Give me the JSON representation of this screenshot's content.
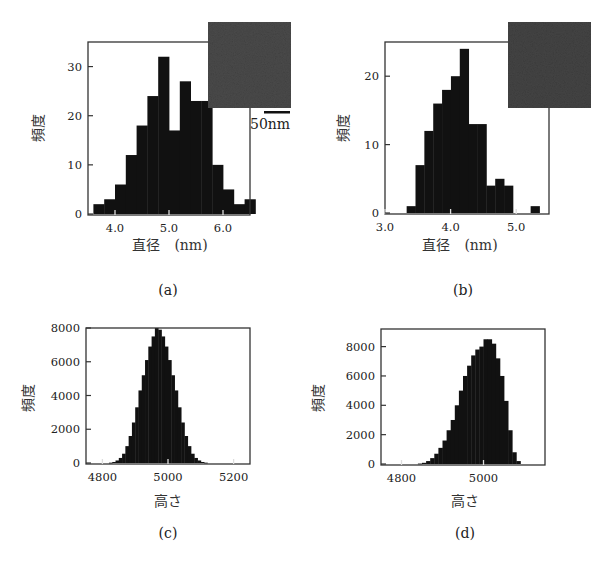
{
  "chart_data": [
    {
      "id": "a",
      "type": "bar",
      "panel_label": "(a)",
      "xlabel": "直径　(nm)",
      "ylabel": "頻度",
      "xlim": [
        3.5,
        6.5
      ],
      "ylim": [
        0,
        35
      ],
      "xticks": [
        4.0,
        5.0,
        6.0
      ],
      "xtick_labels": [
        "4.0",
        "5.0",
        "6.0"
      ],
      "yticks": [
        0,
        10,
        20,
        30
      ],
      "ytick_labels": [
        "0",
        "10",
        "20",
        "30"
      ],
      "bin_start": 3.6,
      "bin_width": 0.2,
      "values": [
        2,
        3,
        6,
        12,
        18,
        24,
        32,
        17,
        27,
        23,
        23,
        10,
        5,
        2,
        3
      ],
      "grid": false,
      "inset": {
        "type": "micrograph",
        "scale_bar_label": "50nm"
      },
      "frame": {
        "x0": 88,
        "y0": 42,
        "x1": 250,
        "y1": 215
      }
    },
    {
      "id": "b",
      "type": "bar",
      "panel_label": "(b)",
      "xlabel": "直径　(nm)",
      "ylabel": "頻度",
      "xlim": [
        3.0,
        5.5
      ],
      "ylim": [
        0,
        25
      ],
      "xticks": [
        3.0,
        4.0,
        5.0
      ],
      "xtick_labels": [
        "3.0",
        "4.0",
        "5.0"
      ],
      "yticks": [
        0,
        10,
        20
      ],
      "ytick_labels": [
        "0",
        "10",
        "20"
      ],
      "bin_start": 3.33,
      "bin_width": 0.135,
      "values": [
        1,
        7,
        12,
        16,
        18,
        20,
        24,
        13,
        13,
        4,
        5,
        4,
        0,
        0,
        1
      ],
      "grid": false,
      "inset": {
        "type": "micrograph",
        "scale_bar_label": ""
      },
      "frame": {
        "x0": 385,
        "y0": 42,
        "x1": 549,
        "y1": 214
      }
    },
    {
      "id": "c",
      "type": "bar",
      "panel_label": "(c)",
      "xlabel": "高さ",
      "ylabel": "頻度",
      "xlim": [
        4750,
        5250
      ],
      "ylim": [
        0,
        8000
      ],
      "xticks": [
        4800,
        5000,
        5200
      ],
      "xtick_labels": [
        "4800",
        "5000",
        "5200"
      ],
      "yticks": [
        0,
        2000,
        4000,
        6000,
        8000
      ],
      "ytick_labels": [
        "0",
        "2000",
        "4000",
        "6000",
        "8000"
      ],
      "bin_start": 4820,
      "bin_width": 10,
      "values": [
        20,
        60,
        150,
        300,
        550,
        1000,
        1600,
        2400,
        3300,
        4300,
        5200,
        6100,
        6900,
        7500,
        8000,
        7900,
        7500,
        6900,
        6100,
        5200,
        4300,
        3300,
        2400,
        1600,
        1000,
        550,
        300,
        150,
        60,
        20
      ],
      "grid": false,
      "frame": {
        "x0": 86,
        "y0": 328,
        "x1": 250,
        "y1": 464
      }
    },
    {
      "id": "d",
      "type": "bar",
      "panel_label": "(d)",
      "xlabel": "高さ",
      "ylabel": "頻度",
      "xlim": [
        4750,
        5150
      ],
      "ylim": [
        0,
        9200
      ],
      "xticks": [
        4800,
        5000
      ],
      "xtick_labels": [
        "4800",
        "5000"
      ],
      "yticks": [
        0,
        2000,
        4000,
        6000,
        8000
      ],
      "ytick_labels": [
        "0",
        "2000",
        "4000",
        "6000",
        "8000"
      ],
      "bin_start": 4840,
      "bin_width": 10,
      "values": [
        30,
        80,
        200,
        400,
        700,
        1100,
        1600,
        2300,
        3000,
        4000,
        5000,
        6000,
        6700,
        7400,
        7800,
        8000,
        8500,
        8500,
        8200,
        7200,
        6000,
        4300,
        2300,
        800,
        200
      ],
      "grid": false,
      "frame": {
        "x0": 381,
        "y0": 329,
        "x1": 545,
        "y1": 465
      }
    }
  ],
  "colors": {
    "bar_fill": "#111111",
    "frame": "#333333",
    "inset": "#4a4a4a",
    "background": "#ffffff"
  }
}
